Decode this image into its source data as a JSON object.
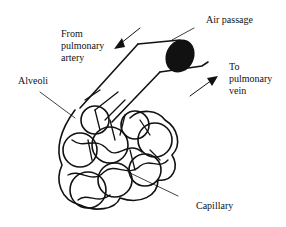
{
  "diagram": {
    "labels": {
      "from_artery": "From\npulmonary\nartery",
      "air_passage": "Air passage",
      "to_vein": "To\npulmonary\nvein",
      "alveoli": "Alveoli",
      "capillary": "Capillary"
    },
    "colors": {
      "ink": "#111111",
      "background": "#ffffff"
    }
  }
}
